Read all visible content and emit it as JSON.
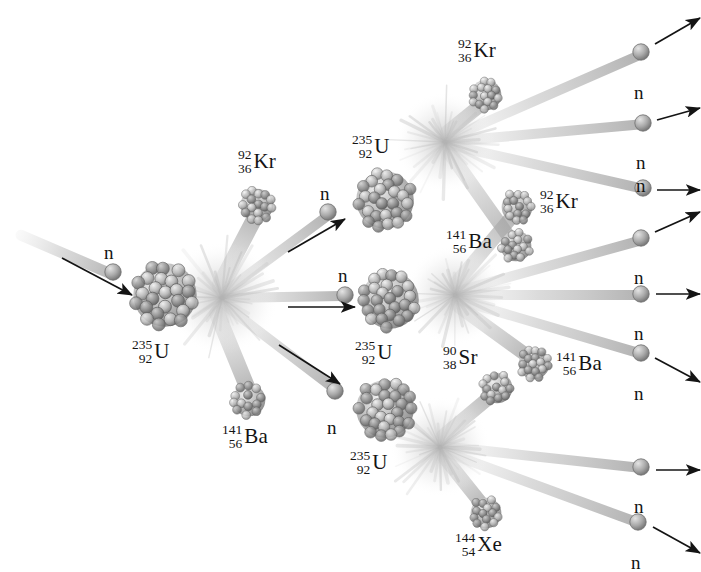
{
  "diagram": {
    "background_color": "#ffffff",
    "ink_color": "#141414",
    "nucleus_color": "#9a9a9a",
    "neutron_color": "#a8a8a8",
    "burst_color": "#b4b4b4",
    "neutron_symbol": "n"
  },
  "nuclei": [
    {
      "id": "u0",
      "symbol": "U",
      "mass": "235",
      "atomic": "92",
      "kind": "uranium",
      "x": 165,
      "y": 295,
      "r": 33,
      "label_x": 132,
      "label_y": 338
    },
    {
      "id": "kr1",
      "symbol": "Kr",
      "mass": "92",
      "atomic": "36",
      "kind": "fragment",
      "x": 257,
      "y": 205,
      "r": 17,
      "label_x": 238,
      "label_y": 148
    },
    {
      "id": "ba1",
      "symbol": "Ba",
      "mass": "141",
      "atomic": "56",
      "kind": "fragment",
      "x": 249,
      "y": 400,
      "r": 17,
      "label_x": 222,
      "label_y": 423
    },
    {
      "id": "u1",
      "symbol": "U",
      "mass": "235",
      "atomic": "92",
      "kind": "uranium",
      "x": 385,
      "y": 200,
      "r": 30,
      "label_x": 352,
      "label_y": 133
    },
    {
      "id": "u2",
      "symbol": "U",
      "mass": "235",
      "atomic": "92",
      "kind": "uranium",
      "x": 390,
      "y": 300,
      "r": 30,
      "label_x": 355,
      "label_y": 339
    },
    {
      "id": "u3",
      "symbol": "U",
      "mass": "235",
      "atomic": "92",
      "kind": "uranium",
      "x": 385,
      "y": 409,
      "r": 30,
      "label_x": 350,
      "label_y": 449
    },
    {
      "id": "kr2",
      "symbol": "Kr",
      "mass": "92",
      "atomic": "36",
      "kind": "fragment",
      "x": 486,
      "y": 95,
      "r": 16,
      "label_x": 458,
      "label_y": 37
    },
    {
      "id": "kr3",
      "symbol": "Kr",
      "mass": "92",
      "atomic": "36",
      "kind": "fragment",
      "x": 517,
      "y": 207,
      "r": 16,
      "label_x": 540,
      "label_y": 188
    },
    {
      "id": "ba2",
      "symbol": "Ba",
      "mass": "141",
      "atomic": "56",
      "kind": "fragment",
      "x": 516,
      "y": 246,
      "r": 16,
      "label_x": 446,
      "label_y": 228
    },
    {
      "id": "ba3",
      "symbol": "Ba",
      "mass": "141",
      "atomic": "56",
      "kind": "fragment",
      "x": 534,
      "y": 364,
      "r": 16,
      "label_x": 556,
      "label_y": 350
    },
    {
      "id": "sr1",
      "symbol": "Sr",
      "mass": "90",
      "atomic": "38",
      "kind": "fragment",
      "x": 497,
      "y": 388,
      "r": 16,
      "label_x": 443,
      "label_y": 344
    },
    {
      "id": "xe1",
      "symbol": "Xe",
      "mass": "144",
      "atomic": "54",
      "kind": "fragment",
      "x": 486,
      "y": 513,
      "r": 16,
      "label_x": 455,
      "label_y": 531
    }
  ],
  "bursts": [
    {
      "id": "burst0",
      "x": 222,
      "y": 298,
      "r": 54
    },
    {
      "id": "burst1",
      "x": 445,
      "y": 142,
      "r": 48
    },
    {
      "id": "burst2",
      "x": 455,
      "y": 295,
      "r": 48
    },
    {
      "id": "burst3",
      "x": 440,
      "y": 447,
      "r": 48
    }
  ],
  "neutrons": [
    {
      "id": "n-in",
      "x": 113,
      "y": 272,
      "label": "n",
      "label_x": 104,
      "label_y": 243,
      "arrow": {
        "x1": 62,
        "y1": 258,
        "x2": 132,
        "y2": 295
      }
    },
    {
      "id": "n-g1-a",
      "x": 328,
      "y": 212,
      "label": "n",
      "label_x": 320,
      "label_y": 184,
      "arrow": {
        "x1": 288,
        "y1": 252,
        "x2": 345,
        "y2": 219
      }
    },
    {
      "id": "n-g1-b",
      "x": 345,
      "y": 295,
      "label": "n",
      "label_x": 338,
      "label_y": 266,
      "arrow": {
        "x1": 288,
        "y1": 307,
        "x2": 355,
        "y2": 307
      }
    },
    {
      "id": "n-g1-c",
      "x": 335,
      "y": 391,
      "label": "n",
      "label_x": 327,
      "label_y": 418,
      "arrow": {
        "x1": 279,
        "y1": 345,
        "x2": 340,
        "y2": 384
      }
    },
    {
      "id": "n-out-1",
      "x": 641,
      "y": 52,
      "label": "n",
      "label_x": 634,
      "label_y": 83,
      "arrow": {
        "x1": 655,
        "y1": 44,
        "x2": 700,
        "y2": 18
      }
    },
    {
      "id": "n-out-2",
      "x": 643,
      "y": 123,
      "label": "n",
      "label_x": 636,
      "label_y": 153,
      "arrow": {
        "x1": 657,
        "y1": 120,
        "x2": 700,
        "y2": 108
      }
    },
    {
      "id": "n-out-3",
      "x": 643,
      "y": 188,
      "label": "n",
      "label_x": 636,
      "label_y": 176,
      "arrow": {
        "x1": 657,
        "y1": 190,
        "x2": 700,
        "y2": 190
      }
    },
    {
      "id": "n-out-4",
      "x": 641,
      "y": 238,
      "label": "n",
      "label_x": 634,
      "label_y": 268,
      "arrow": {
        "x1": 655,
        "y1": 232,
        "x2": 700,
        "y2": 212
      }
    },
    {
      "id": "n-out-5",
      "x": 641,
      "y": 294,
      "label": "n",
      "label_x": 634,
      "label_y": 324,
      "arrow": {
        "x1": 656,
        "y1": 294,
        "x2": 700,
        "y2": 294
      }
    },
    {
      "id": "n-out-6",
      "x": 641,
      "y": 353,
      "label": "n",
      "label_x": 634,
      "label_y": 384,
      "arrow": {
        "x1": 655,
        "y1": 358,
        "x2": 700,
        "y2": 382
      }
    },
    {
      "id": "n-out-7",
      "x": 641,
      "y": 467,
      "label": "n",
      "label_x": 634,
      "label_y": 497,
      "arrow": {
        "x1": 656,
        "y1": 470,
        "x2": 700,
        "y2": 470
      }
    },
    {
      "id": "n-out-8",
      "x": 638,
      "y": 522,
      "label": "n",
      "label_x": 631,
      "label_y": 553,
      "arrow": {
        "x1": 653,
        "y1": 527,
        "x2": 700,
        "y2": 553
      }
    }
  ],
  "trails": [
    {
      "id": "t-in",
      "x1": 16,
      "y1": 233,
      "x2": 118,
      "y2": 277,
      "w": 11
    },
    {
      "id": "t-0-kr",
      "x1": 216,
      "y1": 292,
      "x2": 258,
      "y2": 212,
      "w": 16
    },
    {
      "id": "t-0-ba",
      "x1": 214,
      "y1": 306,
      "x2": 250,
      "y2": 394,
      "w": 16
    },
    {
      "id": "t-0-n1",
      "x1": 222,
      "y1": 294,
      "x2": 330,
      "y2": 214,
      "w": 10
    },
    {
      "id": "t-0-n2",
      "x1": 222,
      "y1": 298,
      "x2": 346,
      "y2": 296,
      "w": 10
    },
    {
      "id": "t-0-n3",
      "x1": 222,
      "y1": 303,
      "x2": 336,
      "y2": 390,
      "w": 10
    },
    {
      "id": "t-1-kr",
      "x1": 441,
      "y1": 137,
      "x2": 487,
      "y2": 100,
      "w": 14
    },
    {
      "id": "t-1-ba",
      "x1": 446,
      "y1": 148,
      "x2": 514,
      "y2": 244,
      "w": 14
    },
    {
      "id": "t-1-n1",
      "x1": 445,
      "y1": 140,
      "x2": 642,
      "y2": 54,
      "w": 10
    },
    {
      "id": "t-1-n2",
      "x1": 445,
      "y1": 142,
      "x2": 644,
      "y2": 124,
      "w": 10
    },
    {
      "id": "t-1-n3",
      "x1": 445,
      "y1": 144,
      "x2": 644,
      "y2": 189,
      "w": 10
    },
    {
      "id": "t-2-kr",
      "x1": 452,
      "y1": 288,
      "x2": 516,
      "y2": 212,
      "w": 14
    },
    {
      "id": "t-2-ba",
      "x1": 453,
      "y1": 302,
      "x2": 533,
      "y2": 360,
      "w": 14
    },
    {
      "id": "t-2-n1",
      "x1": 455,
      "y1": 292,
      "x2": 642,
      "y2": 240,
      "w": 10
    },
    {
      "id": "t-2-n2",
      "x1": 455,
      "y1": 295,
      "x2": 642,
      "y2": 295,
      "w": 10
    },
    {
      "id": "t-2-n3",
      "x1": 455,
      "y1": 299,
      "x2": 642,
      "y2": 354,
      "w": 10
    },
    {
      "id": "t-3-sr",
      "x1": 437,
      "y1": 441,
      "x2": 496,
      "y2": 392,
      "w": 14
    },
    {
      "id": "t-3-xe",
      "x1": 440,
      "y1": 452,
      "x2": 485,
      "y2": 508,
      "w": 14
    },
    {
      "id": "t-3-n1",
      "x1": 440,
      "y1": 446,
      "x2": 642,
      "y2": 468,
      "w": 10
    },
    {
      "id": "t-3-n2",
      "x1": 440,
      "y1": 450,
      "x2": 639,
      "y2": 523,
      "w": 10
    }
  ]
}
